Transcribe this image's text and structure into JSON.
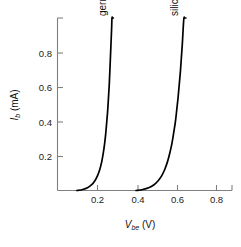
{
  "chart_data": {
    "type": "line",
    "title": "",
    "xlabel": "V_be (V)",
    "xlabel_main": "V",
    "xlabel_sub": "be",
    "xlabel_unit": "(V)",
    "ylabel": "I_b (mA)",
    "ylabel_main": "I",
    "ylabel_sub": "b",
    "ylabel_unit": "(mA)",
    "xlim": [
      0.0,
      0.9
    ],
    "ylim": [
      0.0,
      1.0
    ],
    "xticks": [
      0.2,
      0.4,
      0.6,
      0.8
    ],
    "xtick_labels": [
      "0.2",
      "0.4",
      "0.6",
      "0.8"
    ],
    "yticks": [
      0.2,
      0.4,
      0.6,
      0.8
    ],
    "ytick_labels": [
      "0.2",
      "0.4",
      "0.6",
      "0.8"
    ],
    "grid": false,
    "legend_position": "inline-curve-labels",
    "series": [
      {
        "name": "germanium",
        "label": "germanium",
        "color": "#000000",
        "label_rotation_deg": -90,
        "x": [
          0.1,
          0.13,
          0.155,
          0.175,
          0.192,
          0.206,
          0.218,
          0.228,
          0.236,
          0.243,
          0.249,
          0.254,
          0.259,
          0.263,
          0.267,
          0.27,
          0.273,
          0.276,
          0.279,
          0.281,
          0.284,
          0.286,
          0.288
        ],
        "y": [
          0.0,
          0.006,
          0.016,
          0.032,
          0.055,
          0.085,
          0.122,
          0.166,
          0.216,
          0.272,
          0.333,
          0.398,
          0.467,
          0.54,
          0.615,
          0.692,
          0.772,
          0.853,
          0.935,
          1.0,
          1.0,
          1.0,
          1.0
        ]
      },
      {
        "name": "silicon",
        "label": "silicon",
        "color": "#000000",
        "label_rotation_deg": -90,
        "x": [
          0.405,
          0.44,
          0.47,
          0.496,
          0.518,
          0.537,
          0.553,
          0.567,
          0.579,
          0.59,
          0.599,
          0.608,
          0.615,
          0.622,
          0.628,
          0.634,
          0.639,
          0.644,
          0.648,
          0.652,
          0.656,
          0.659,
          0.662
        ],
        "y": [
          0.0,
          0.006,
          0.016,
          0.032,
          0.055,
          0.085,
          0.122,
          0.166,
          0.216,
          0.272,
          0.333,
          0.398,
          0.467,
          0.54,
          0.615,
          0.692,
          0.772,
          0.853,
          0.935,
          1.0,
          1.0,
          1.0,
          1.0
        ]
      }
    ]
  },
  "figure": {
    "background_color": "#ffffff",
    "axis_color": "#808080",
    "curve_color": "#000000"
  }
}
